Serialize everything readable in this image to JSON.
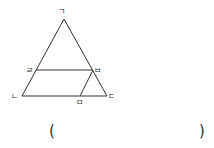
{
  "diagram": {
    "type": "triangle-with-parallel-segments",
    "stroke_color": "#333333",
    "points": {
      "giyeok": {
        "label": "ㄱ",
        "x": 64,
        "y": 19
      },
      "nieun": {
        "label": "ㄴ",
        "x": 22,
        "y": 96
      },
      "digeut": {
        "label": "ㄷ",
        "x": 107,
        "y": 96
      },
      "rieul": {
        "label": "ㄹ",
        "x": 36,
        "y": 70
      },
      "bieup": {
        "label": "ㅂ",
        "x": 93,
        "y": 70
      },
      "mieum": {
        "label": "ㅁ",
        "x": 80,
        "y": 96
      }
    },
    "segments": [
      {
        "from": "ㄱ",
        "to": "ㄴ"
      },
      {
        "from": "ㄱ",
        "to": "ㄷ"
      },
      {
        "from": "ㄴ",
        "to": "ㄷ"
      },
      {
        "from": "ㄹ",
        "to": "ㅂ"
      },
      {
        "from": "ㅂ",
        "to": "ㅁ"
      }
    ]
  },
  "answer": {
    "open_paren": "(",
    "close_paren": ")",
    "value": ""
  }
}
